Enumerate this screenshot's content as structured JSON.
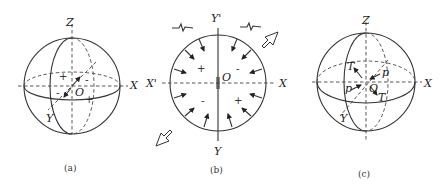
{
  "figure": {
    "panels": [
      {
        "id": "a",
        "caption": "(a)",
        "axes": {
          "z": "Z",
          "x": "X",
          "y": "Y",
          "origin": "O"
        },
        "signs": [
          "+",
          "-",
          "-",
          "+"
        ]
      },
      {
        "id": "b",
        "caption": "(b)",
        "axes": {
          "y_top": "Y'",
          "x_left": "X'",
          "x_right": "X",
          "y_bottom": "Y",
          "origin": "O"
        },
        "signs": [
          "+",
          "-",
          "-",
          "+"
        ]
      },
      {
        "id": "c",
        "caption": "(c)",
        "axes": {
          "z": "Z",
          "x": "X",
          "y": "Y",
          "origin": "O"
        },
        "vectors": [
          "T",
          "p",
          "p",
          "T"
        ]
      }
    ]
  }
}
